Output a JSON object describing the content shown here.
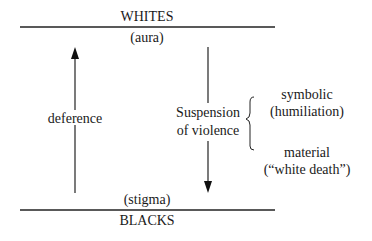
{
  "top": {
    "label": "WHITES",
    "sublabel": "(aura)"
  },
  "bottom": {
    "label": "BLACKS",
    "sublabel": "(stigma)"
  },
  "left_arrow": {
    "label": "deference",
    "direction": "up"
  },
  "right_arrow": {
    "label_line1": "Suspension",
    "label_line2": "of violence",
    "direction": "down"
  },
  "forms": [
    {
      "line1": "symbolic",
      "line2": "(humiliation)"
    },
    {
      "line1": "material",
      "line2": "(“white death”)"
    }
  ]
}
